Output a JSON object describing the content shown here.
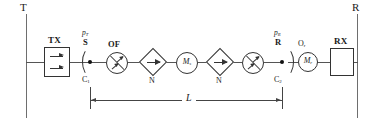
{
  "diagram": {
    "endpoints": {
      "left_label": "T",
      "right_label": "R"
    },
    "terminals": [
      {
        "id": "tx",
        "label": "TX",
        "shape": "square-with-arrows"
      },
      {
        "id": "rx",
        "label": "RX",
        "shape": "square"
      }
    ],
    "connectors": [
      {
        "id": "c1",
        "node_label": "C",
        "node_sub": "1",
        "power_symbol": "p",
        "power_sub": "T",
        "port_label": "S"
      },
      {
        "id": "c2",
        "node_label": "C",
        "node_sub": "2",
        "power_symbol": "p",
        "power_sub": "R",
        "port_label": "R"
      }
    ],
    "components": [
      {
        "id": "of",
        "label": "OF",
        "sub": "",
        "shape": "circle-amplifier",
        "caption": ""
      },
      {
        "id": "n1",
        "label": "",
        "sub": "",
        "shape": "diamond-arrow",
        "caption": "N"
      },
      {
        "id": "m1",
        "label": "M",
        "sub": "s",
        "shape": "circle-letter",
        "caption": ""
      },
      {
        "id": "n2",
        "label": "",
        "sub": "",
        "shape": "diamond-arrow",
        "caption": "N"
      },
      {
        "id": "amp2",
        "label": "",
        "sub": "",
        "shape": "circle-amplifier",
        "caption": ""
      },
      {
        "id": "or",
        "label": "M",
        "sub": "r",
        "shape": "circle-letter",
        "caption": "",
        "top_label": "O",
        "top_sub": "r"
      }
    ],
    "dimension": {
      "label": "L",
      "from": "C1",
      "to": "C2"
    },
    "colors": {
      "line": "#555555",
      "stroke": "#333333",
      "node": "#111111",
      "background": "#ffffff"
    }
  }
}
